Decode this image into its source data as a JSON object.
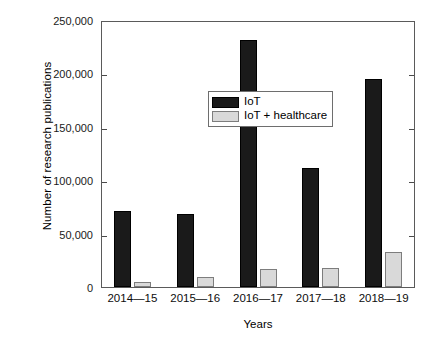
{
  "chart_data": {
    "type": "bar",
    "title": "",
    "xlabel": "Years",
    "ylabel": "Number of research publications",
    "categories": [
      "2014—15",
      "2015—16",
      "2016—17",
      "2017—18",
      "2018—19"
    ],
    "series": [
      {
        "name": "IoT",
        "color": "#1a1a1a",
        "values": [
          71000,
          68500,
          231000,
          111500,
          195000
        ]
      },
      {
        "name": "IoT + healthcare",
        "color": "#d9d9d9",
        "values": [
          5000,
          9500,
          17000,
          18000,
          33000
        ]
      }
    ],
    "ylim": [
      0,
      250000
    ],
    "yticks": [
      0,
      50000,
      100000,
      150000,
      200000,
      250000
    ],
    "ytick_labels": [
      "0",
      "50,000",
      "100,000",
      "150,000",
      "200,000",
      "250,000"
    ],
    "grid": false,
    "legend_position": "upper-left-inside"
  },
  "legend": {
    "entries": [
      {
        "label": "IoT",
        "swatch": "black-swatch"
      },
      {
        "label": "IoT + healthcare",
        "swatch": "light-gray-swatch"
      }
    ]
  }
}
